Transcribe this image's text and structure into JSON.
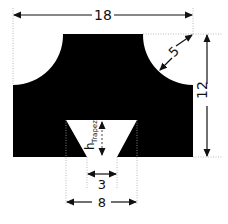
{
  "diagram": {
    "shape_color": "#000000",
    "line_color": "#222222",
    "dimensions": {
      "total_width": "18",
      "total_height": "12",
      "radius": "5",
      "trapezoid_top_width": "8",
      "trapezoid_bottom_width": "3",
      "trapezoid_height_label": "h",
      "trapezoid_height_subscript": "Trapez"
    }
  }
}
